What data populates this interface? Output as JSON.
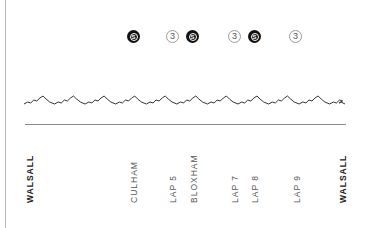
{
  "diagram": {
    "type": "route-elevation-profile",
    "colors": {
      "line": "#333333",
      "baseline": "#8a8a8a",
      "solid_badge": "#111111",
      "outline_badge": "#9a9a9a",
      "label": "#555555",
      "endpoint_label": "#222222"
    },
    "badges": [
      {
        "kind": "solid",
        "glyph": "S",
        "x": 127
      },
      {
        "kind": "outline",
        "glyph": "3",
        "x": 166
      },
      {
        "kind": "solid",
        "glyph": "S",
        "x": 186
      },
      {
        "kind": "outline",
        "glyph": "3",
        "x": 228
      },
      {
        "kind": "solid",
        "glyph": "S",
        "x": 248
      },
      {
        "kind": "outline",
        "glyph": "3",
        "x": 289
      }
    ],
    "labels": [
      {
        "text": "WALSALL",
        "x": 25,
        "bold": true
      },
      {
        "text": "CULHAM",
        "x": 129,
        "bold": false
      },
      {
        "text": "LAP 5",
        "x": 168,
        "bold": false
      },
      {
        "text": "BLOXHAM",
        "x": 189,
        "bold": false
      },
      {
        "text": "LAP 7",
        "x": 230,
        "bold": false
      },
      {
        "text": "LAP 8",
        "x": 250,
        "bold": false
      },
      {
        "text": "LAP 9",
        "x": 292,
        "bold": false
      },
      {
        "text": "WALSALL",
        "x": 338,
        "bold": true
      }
    ]
  }
}
